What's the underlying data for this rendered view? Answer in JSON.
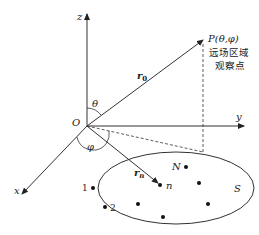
{
  "axes": {
    "x": "x",
    "y": "y",
    "z": "z",
    "origin": "O"
  },
  "angles": {
    "theta": "θ",
    "phi": "φ"
  },
  "vectors": {
    "r0": "r",
    "r0_sub": "0",
    "rn": "r",
    "rn_sub": "n"
  },
  "point_p": {
    "label": "P(θ,φ)",
    "caption_line1": "远场区域",
    "caption_line2": "观察点"
  },
  "surface": {
    "label": "S",
    "points": [
      {
        "label": "1"
      },
      {
        "label": "2"
      },
      {
        "label": "n"
      },
      {
        "label": "N"
      }
    ]
  }
}
